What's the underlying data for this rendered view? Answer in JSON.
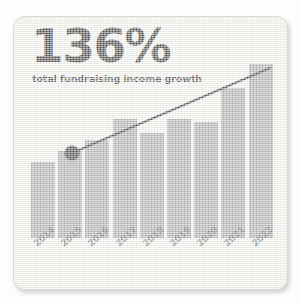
{
  "card": {
    "headline": "136%",
    "subtitle": "total fundraising income growth",
    "background_color": "#efefec",
    "border_color": "#d8d8d4"
  },
  "chart_data": {
    "type": "bar",
    "title": "136%",
    "subtitle": "total fundraising income growth",
    "xlabel": "",
    "ylabel": "",
    "grid": false,
    "legend": false,
    "categories": [
      "2014",
      "2015",
      "2016",
      "2017",
      "2018",
      "2019",
      "2020",
      "2021",
      "2022"
    ],
    "values": [
      74,
      84,
      95,
      115,
      102,
      115,
      112,
      145,
      168
    ],
    "ylim": [
      0,
      180
    ],
    "bar_color": "#9b9b9b",
    "series": [
      {
        "name": "total fundraising income",
        "values": [
          74,
          84,
          95,
          115,
          102,
          115,
          112,
          145,
          168
        ]
      }
    ],
    "annotations": [
      {
        "type": "trendline",
        "color": "#231f20",
        "start": {
          "category": "2015",
          "value": 85
        },
        "end": {
          "category": "2022",
          "value": 170
        },
        "marker": "filled-circle",
        "marker_at": "2015"
      }
    ]
  }
}
